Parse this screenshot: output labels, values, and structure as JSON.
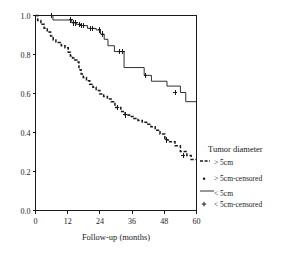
{
  "chart_data": {
    "type": "line",
    "title": "",
    "xlabel": "Follow-up (months)",
    "ylabel": "",
    "xlim": [
      0,
      60
    ],
    "ylim": [
      0.0,
      1.0
    ],
    "xticks": [
      0,
      12,
      24,
      36,
      48,
      60
    ],
    "xtick_labels": [
      "0",
      "12",
      "24",
      "36",
      "48",
      "60"
    ],
    "yticks": [
      0.0,
      0.2,
      0.4,
      0.6,
      0.8,
      1.0
    ],
    "ytick_labels": [
      "0.0",
      "0.2",
      "0.4",
      "0.6",
      "0.8",
      "1.0"
    ],
    "grid": false,
    "legend_position": "right",
    "series": [
      {
        "name": "< 5cm",
        "style": "solid",
        "color": "#1a1a1a",
        "x": [
          0,
          1.2,
          6.5,
          6.5,
          13.5,
          13.5,
          15.2,
          15.2,
          17.0,
          17.0,
          19.4,
          19.4,
          22.6,
          22.6,
          24.2,
          24.2,
          25.6,
          25.6,
          27.0,
          27.0,
          29.4,
          29.4,
          33.0,
          33.0,
          40.5,
          40.5,
          43.2,
          43.2,
          49.0,
          49.0,
          54.0,
          54.0,
          56.0,
          56.0,
          60.0
        ],
        "y": [
          1.0,
          1.0,
          1.0,
          0.977,
          0.977,
          0.962,
          0.962,
          0.955,
          0.955,
          0.948,
          0.948,
          0.934,
          0.934,
          0.926,
          0.926,
          0.905,
          0.905,
          0.878,
          0.878,
          0.845,
          0.845,
          0.815,
          0.815,
          0.733,
          0.733,
          0.693,
          0.693,
          0.663,
          0.663,
          0.638,
          0.638,
          0.605,
          0.605,
          0.558,
          0.558
        ],
        "censored_x": [
          6.0,
          13.2,
          14.2,
          15.0,
          16.4,
          17.2,
          17.8,
          20.6,
          21.4,
          23.8,
          25.0,
          31.2,
          32.6,
          41.0,
          52.0
        ],
        "censored_y": [
          1.0,
          0.977,
          0.962,
          0.962,
          0.955,
          0.948,
          0.948,
          0.934,
          0.934,
          0.926,
          0.905,
          0.815,
          0.815,
          0.693,
          0.605
        ]
      },
      {
        "name": "> 5cm",
        "style": "dashed",
        "color": "#1a1a1a",
        "x": [
          0,
          0.8,
          0.8,
          2.0,
          2.0,
          3.2,
          3.2,
          4.4,
          4.4,
          5.6,
          5.6,
          6.6,
          6.6,
          7.6,
          7.6,
          9.6,
          9.6,
          11.0,
          11.0,
          12.2,
          12.2,
          13.0,
          13.0,
          13.8,
          13.8,
          14.6,
          14.6,
          15.4,
          15.4,
          16.2,
          16.2,
          17.0,
          17.0,
          17.8,
          17.8,
          19.0,
          19.0,
          20.2,
          20.2,
          21.4,
          21.4,
          22.6,
          22.6,
          24.0,
          24.0,
          25.4,
          25.4,
          26.8,
          26.8,
          28.2,
          28.2,
          29.6,
          29.6,
          31.8,
          31.8,
          33.4,
          33.4,
          35.0,
          35.0,
          36.6,
          36.6,
          38.2,
          38.2,
          39.8,
          39.8,
          41.4,
          41.4,
          43.0,
          43.0,
          44.6,
          44.6,
          46.4,
          46.4,
          48.2,
          48.2,
          50.0,
          50.0,
          52.0,
          52.0,
          54.0,
          54.0,
          56.4,
          56.4,
          58.0,
          58.0,
          60.0
        ],
        "y": [
          1.0,
          1.0,
          0.975,
          0.975,
          0.955,
          0.955,
          0.935,
          0.935,
          0.915,
          0.915,
          0.895,
          0.895,
          0.875,
          0.875,
          0.862,
          0.862,
          0.845,
          0.845,
          0.835,
          0.835,
          0.812,
          0.812,
          0.792,
          0.792,
          0.782,
          0.782,
          0.772,
          0.772,
          0.762,
          0.762,
          0.722,
          0.722,
          0.7,
          0.7,
          0.682,
          0.682,
          0.665,
          0.665,
          0.648,
          0.648,
          0.632,
          0.632,
          0.615,
          0.615,
          0.598,
          0.598,
          0.585,
          0.585,
          0.572,
          0.572,
          0.558,
          0.558,
          0.528,
          0.528,
          0.508,
          0.508,
          0.49,
          0.49,
          0.482,
          0.482,
          0.472,
          0.472,
          0.462,
          0.462,
          0.452,
          0.452,
          0.442,
          0.442,
          0.43,
          0.43,
          0.412,
          0.412,
          0.392,
          0.392,
          0.362,
          0.362,
          0.352,
          0.352,
          0.332,
          0.332,
          0.302,
          0.302,
          0.282,
          0.282,
          0.262,
          0.262
        ],
        "censored_x": [
          30.6,
          33.4,
          48.8,
          55.0
        ],
        "censored_y": [
          0.528,
          0.49,
          0.362,
          0.282
        ]
      }
    ]
  },
  "legend": {
    "title": "Tumor diameter",
    "entries": [
      {
        "label": "> 5cm",
        "marker": "dashed-line"
      },
      {
        "label": "> 5cm-censored",
        "marker": "square-dot"
      },
      {
        "label": "< 5cm",
        "marker": "solid-line"
      },
      {
        "label": "< 5cm-censored",
        "marker": "plus-sign"
      }
    ]
  },
  "axes": {
    "x_title": "Follow-up (months)"
  },
  "colors": {
    "ink": "#1a1a1a",
    "background": "#ffffff"
  }
}
